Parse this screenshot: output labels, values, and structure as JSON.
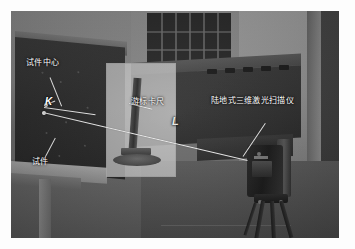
{
  "figure": {
    "type": "photograph",
    "border_color": "#ffffff"
  },
  "annotations": {
    "specimen_center": {
      "label": "试件中心",
      "meaning": "specimen center",
      "x": 28,
      "y": 60
    },
    "specimen": {
      "label": "试件",
      "meaning": "specimen",
      "x": 40,
      "y": 158
    },
    "vernier_caliper": {
      "label": "游标卡尺",
      "meaning": "vernier caliper",
      "x": 131,
      "y": 99
    },
    "laser_scanner": {
      "label": "陆地式三维激光扫描仪",
      "meaning": "terrestrial 3D laser scanner",
      "x": 212,
      "y": 98
    },
    "point_k": {
      "label": "K",
      "meaning": "measurement point K",
      "x": 44,
      "y": 101
    },
    "distance_l": {
      "label": "L",
      "meaning": "measurement distance L",
      "x": 174,
      "y": 120
    }
  },
  "colors": {
    "leader_line": "#f2f2ef",
    "label_text": "#ffffff",
    "inset_overlay": "#cdcdc6",
    "photo_background": "#6e6e6e"
  }
}
